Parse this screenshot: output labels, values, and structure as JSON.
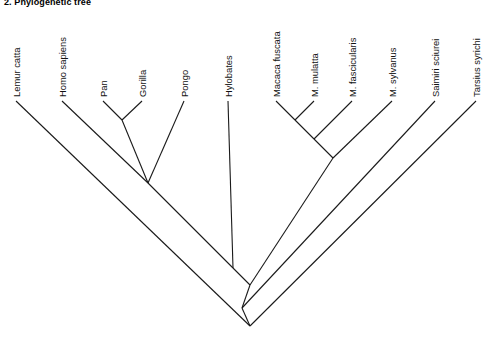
{
  "figure": {
    "title": "2. Phylogenetic tree",
    "width": 497,
    "height": 351,
    "background": "#ffffff",
    "line_color": "#1a1a1a",
    "text_color": "#111111"
  },
  "chart_data": {
    "type": "diagram",
    "diagram_type": "cladogram",
    "title": "2. Phylogenetic tree",
    "orientation": "tips-at-top, root-at-bottom, V-shaped branches",
    "taxa_count": 12,
    "label_rotation_deg": -90,
    "taxa": [
      {
        "name": "Lemur catta",
        "tip_x": 16,
        "tip_y": 101,
        "label_x": 20,
        "label_y": 97
      },
      {
        "name": "Homo sapiens",
        "tip_x": 62,
        "tip_y": 101,
        "label_x": 66,
        "label_y": 97
      },
      {
        "name": "Pan",
        "tip_x": 103,
        "tip_y": 101,
        "label_x": 107,
        "label_y": 97
      },
      {
        "name": "Gorilla",
        "tip_x": 142,
        "tip_y": 101,
        "label_x": 146,
        "label_y": 97
      },
      {
        "name": "Pongo",
        "tip_x": 184,
        "tip_y": 101,
        "label_x": 188,
        "label_y": 97
      },
      {
        "name": "Hylobates",
        "tip_x": 228,
        "tip_y": 101,
        "label_x": 232,
        "label_y": 97
      },
      {
        "name": "Macaca fuscata",
        "tip_x": 276,
        "tip_y": 101,
        "label_x": 280,
        "label_y": 97
      },
      {
        "name": "M. mulatta",
        "tip_x": 314,
        "tip_y": 101,
        "label_x": 318,
        "label_y": 97
      },
      {
        "name": "M. fascicularis",
        "tip_x": 352,
        "tip_y": 101,
        "label_x": 356,
        "label_y": 97
      },
      {
        "name": "M. sylvanus",
        "tip_x": 392,
        "tip_y": 101,
        "label_x": 396,
        "label_y": 97
      },
      {
        "name": "Saimiri sciurei",
        "tip_x": 435,
        "tip_y": 101,
        "label_x": 439,
        "label_y": 97
      },
      {
        "name": "Tarsius syrichi",
        "tip_x": 476,
        "tip_y": 101,
        "label_x": 480,
        "label_y": 97
      }
    ],
    "nodes": [
      {
        "id": "pan-gorilla",
        "x": 122,
        "y": 120,
        "children": [
          "Pan",
          "Gorilla"
        ]
      },
      {
        "id": "homininae",
        "x": 127,
        "y": 162,
        "children": [
          "Homo sapiens",
          "pan-gorilla"
        ]
      },
      {
        "id": "great-apes",
        "x": 148,
        "y": 183,
        "children": [
          "homininae",
          "Pongo"
        ]
      },
      {
        "id": "hominoidea",
        "x": 233,
        "y": 268,
        "children": [
          "great-apes",
          "Hylobates"
        ]
      },
      {
        "id": "fuscata-mulatta",
        "x": 295,
        "y": 120,
        "children": [
          "Macaca fuscata",
          "M. mulatta"
        ]
      },
      {
        "id": "macaca-3",
        "x": 314,
        "y": 139,
        "children": [
          "fuscata-mulatta",
          "M. fascicularis"
        ]
      },
      {
        "id": "macaca-all",
        "x": 333,
        "y": 158,
        "children": [
          "macaca-3",
          "M. sylvanus"
        ]
      },
      {
        "id": "catarrhini",
        "x": 250,
        "y": 285,
        "children": [
          "hominoidea",
          "macaca-all"
        ]
      },
      {
        "id": "haplorhini-simii",
        "x": 242,
        "y": 308,
        "children": [
          "catarrhini",
          "Saimiri sciurei"
        ]
      },
      {
        "id": "root",
        "x": 250,
        "y": 326,
        "children": [
          "haplorhini-simii",
          "Tarsius syrichi"
        ]
      }
    ],
    "segments": [
      {
        "from": [
          16,
          101
        ],
        "to": [
          250,
          326
        ],
        "label": "Lemur catta to root"
      },
      {
        "from": [
          103,
          101
        ],
        "to": [
          122,
          120
        ],
        "label": "Pan to pan-gorilla"
      },
      {
        "from": [
          142,
          101
        ],
        "to": [
          122,
          120
        ],
        "label": "Gorilla to pan-gorilla"
      },
      {
        "from": [
          122,
          120
        ],
        "to": [
          148,
          183
        ],
        "label": "pan-gorilla to great-apes"
      },
      {
        "from": [
          62,
          101
        ],
        "to": [
          148,
          183
        ],
        "label": "Homo sapiens to great-apes"
      },
      {
        "from": [
          184,
          101
        ],
        "to": [
          148,
          183
        ],
        "label": "Pongo to great-apes"
      },
      {
        "from": [
          148,
          183
        ],
        "to": [
          233,
          268
        ],
        "label": "great-apes to hominoidea"
      },
      {
        "from": [
          228,
          101
        ],
        "to": [
          233,
          268
        ],
        "label": "Hylobates to hominoidea"
      },
      {
        "from": [
          276,
          101
        ],
        "to": [
          295,
          120
        ],
        "label": "Macaca fuscata to node"
      },
      {
        "from": [
          314,
          101
        ],
        "to": [
          295,
          120
        ],
        "label": "M. mulatta to node"
      },
      {
        "from": [
          295,
          120
        ],
        "to": [
          314,
          139
        ],
        "label": "node to macaca-3"
      },
      {
        "from": [
          352,
          101
        ],
        "to": [
          314,
          139
        ],
        "label": "M. fascicularis to macaca-3"
      },
      {
        "from": [
          314,
          139
        ],
        "to": [
          333,
          158
        ],
        "label": "macaca-3 to macaca-all"
      },
      {
        "from": [
          392,
          101
        ],
        "to": [
          333,
          158
        ],
        "label": "M. sylvanus to macaca-all"
      },
      {
        "from": [
          333,
          158
        ],
        "to": [
          250,
          285
        ],
        "label": "macaca-all to catarrhini"
      },
      {
        "from": [
          233,
          268
        ],
        "to": [
          250,
          285
        ],
        "label": "hominoidea to catarrhini"
      },
      {
        "from": [
          250,
          285
        ],
        "to": [
          242,
          308
        ],
        "label": "catarrhini to simiiformes"
      },
      {
        "from": [
          435,
          101
        ],
        "to": [
          242,
          308
        ],
        "label": "Saimiri sciurei to simiiformes"
      },
      {
        "from": [
          242,
          308
        ],
        "to": [
          250,
          326
        ],
        "label": "simiiformes to root"
      },
      {
        "from": [
          476,
          101
        ],
        "to": [
          250,
          326
        ],
        "label": "Tarsius syrichi to root"
      }
    ]
  }
}
